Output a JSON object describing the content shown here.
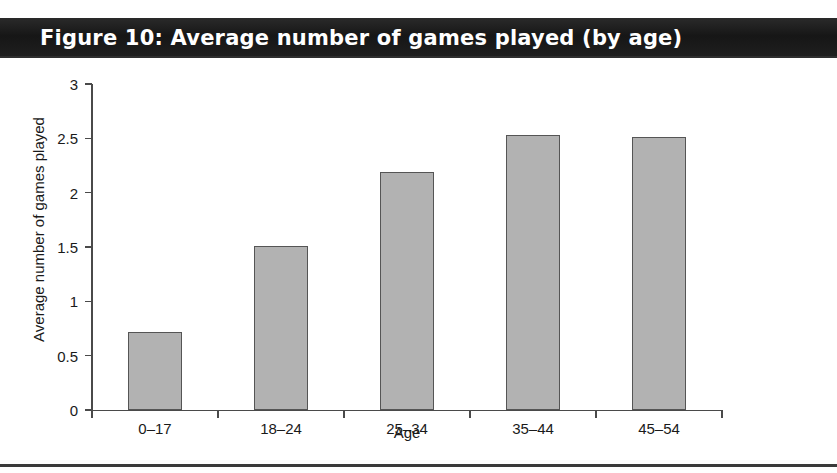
{
  "figure": {
    "title": "Figure 10: Average number of games played (by age)"
  },
  "colors": {
    "title_bar_background": "#1c1c1c",
    "title_text": "#ffffff",
    "bar_fill": "#b2b2b2",
    "bar_border": "#555555",
    "axis": "#4a4a4a",
    "page_background": "#ffffff",
    "bottom_rule": "#3a3a3a"
  },
  "chart_data": {
    "type": "bar",
    "title": "Figure 10: Average number of games played (by age)",
    "xlabel": "Age",
    "ylabel": "Average number of games played",
    "categories": [
      "0–17",
      "18–24",
      "25–34",
      "35–44",
      "45–54"
    ],
    "values": [
      0.72,
      1.51,
      2.19,
      2.53,
      2.51
    ],
    "ylim": [
      0,
      3
    ],
    "yticks": [
      0,
      0.5,
      1,
      1.5,
      2,
      2.5,
      3
    ],
    "ytick_labels": [
      "0",
      "0.5",
      "1",
      "1.5",
      "2",
      "2.5",
      "3"
    ],
    "grid": false,
    "legend": null,
    "legend_position": "none",
    "orientation": "vertical"
  }
}
